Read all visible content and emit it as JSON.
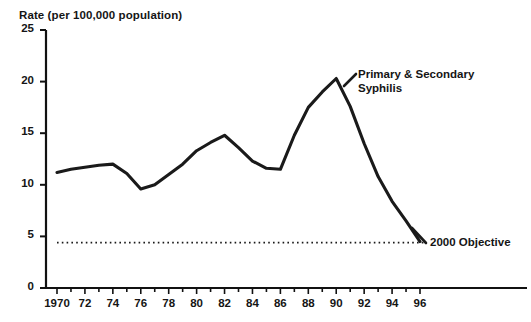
{
  "chart_data": {
    "type": "line",
    "title": "Rate (per 100,000 population)",
    "xlabel": "",
    "ylabel": "Rate (per 100,000 population)",
    "xlim": [
      1970,
      1996
    ],
    "ylim": [
      0,
      25
    ],
    "grid": false,
    "legend_position": "inline-annotation",
    "y_ticks": [
      "0",
      "5",
      "10",
      "15",
      "20",
      "25"
    ],
    "y_tick_values": [
      0,
      5,
      10,
      15,
      20,
      25
    ],
    "x_ticks": [
      "1970",
      "72",
      "74",
      "76",
      "78",
      "80",
      "82",
      "84",
      "86",
      "88",
      "90",
      "92",
      "94",
      "96"
    ],
    "x_tick_values": [
      1970,
      1972,
      1974,
      1976,
      1978,
      1980,
      1982,
      1984,
      1986,
      1988,
      1990,
      1992,
      1994,
      1996
    ],
    "series": [
      {
        "name": "Primary & Secondary Syphilis",
        "annotation": "Primary & Secondary\nSyphilis",
        "color": "#1a1a1a",
        "style": "solid",
        "x": [
          1970,
          1971,
          1972,
          1973,
          1974,
          1975,
          1976,
          1977,
          1978,
          1979,
          1980,
          1981,
          1982,
          1983,
          1984,
          1985,
          1986,
          1987,
          1988,
          1989,
          1990,
          1991,
          1992,
          1993,
          1994,
          1995,
          1996
        ],
        "values": [
          11.2,
          11.5,
          11.7,
          11.9,
          12.0,
          11.1,
          9.6,
          10.0,
          11.0,
          12.0,
          13.3,
          14.1,
          14.8,
          13.6,
          12.3,
          11.6,
          11.5,
          14.8,
          17.5,
          19.0,
          20.3,
          17.6,
          14.0,
          10.8,
          8.4,
          6.5,
          4.5
        ]
      },
      {
        "name": "2000 Objective",
        "annotation": "2000 Objective",
        "color": "#1a1a1a",
        "style": "dotted",
        "value": 4.4,
        "x_start": 1970,
        "x_end": 1996
      }
    ]
  }
}
